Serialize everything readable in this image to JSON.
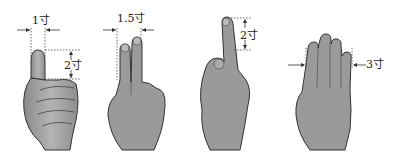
{
  "diagram": {
    "panels": [
      {
        "id": "thumb",
        "measure_label": "1寸",
        "length_label": "2寸",
        "description": "Thumb width = 1 cun, thumb tip segment = 2 cun"
      },
      {
        "id": "two-fingers",
        "measure_label": "1.5寸",
        "description": "Index + middle finger width = 1.5 cun"
      },
      {
        "id": "middle-finger",
        "measure_label": "2寸",
        "description": "Middle finger distal two segments = 2 cun"
      },
      {
        "id": "four-fingers",
        "measure_label": "3寸",
        "description": "Four fingers width = 3 cun"
      }
    ],
    "colors": {
      "skin": "#9a9a9a",
      "skin_light": "#c8c8c8",
      "outline": "#333333",
      "guide": "#444444"
    }
  }
}
